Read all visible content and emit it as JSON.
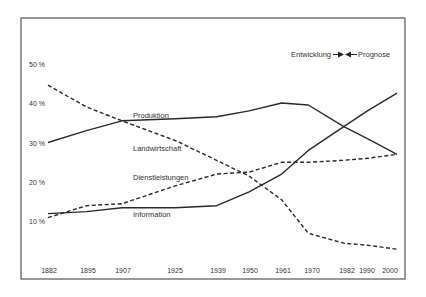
{
  "chart_data": {
    "type": "line",
    "title": "",
    "xlabel": "",
    "ylabel": "",
    "ylim": [
      0,
      50
    ],
    "grid": false,
    "x": [
      1882,
      1895,
      1907,
      1925,
      1939,
      1950,
      1961,
      1970,
      1982,
      1990,
      2000
    ],
    "x_tick_labels": [
      "1882",
      "1895",
      "1907",
      "1925",
      "1939",
      "1950",
      "1961",
      "1970",
      "1982",
      "1990",
      "2000"
    ],
    "y_ticks": [
      10,
      20,
      30,
      40,
      50
    ],
    "y_tick_labels": [
      "10 %",
      "20 %",
      "30 %",
      "40 %",
      "50 %"
    ],
    "series": [
      {
        "name": "Landwirtschaft",
        "style": "dashed",
        "values": [
          44.5,
          39,
          35.5,
          30.5,
          25.5,
          21.5,
          15.5,
          7,
          4.5,
          4,
          3
        ]
      },
      {
        "name": "Produktion",
        "style": "solid",
        "values": [
          30,
          33,
          35.5,
          36,
          36.5,
          38,
          40,
          39.5,
          34,
          31,
          27
        ]
      },
      {
        "name": "Dienstleistungen",
        "style": "dashed",
        "values": [
          11,
          14,
          14.5,
          19,
          22,
          22.5,
          25,
          25,
          25.5,
          26,
          27
        ]
      },
      {
        "name": "Information",
        "style": "solid",
        "values": [
          12,
          12.5,
          13.5,
          13.5,
          14,
          17.5,
          22,
          28,
          34,
          38,
          42.5
        ]
      }
    ],
    "annotations": {
      "legend_left": "Entwicklung",
      "legend_right": "Prognose"
    },
    "series_labels": [
      {
        "name": "Produktion",
        "x": 133,
        "y": 118
      },
      {
        "name": "Landwirtschaft",
        "x": 133,
        "y": 150
      },
      {
        "name": "Dienstleistungen",
        "x": 133,
        "y": 179
      },
      {
        "name": "Information",
        "x": 133,
        "y": 216
      }
    ]
  }
}
